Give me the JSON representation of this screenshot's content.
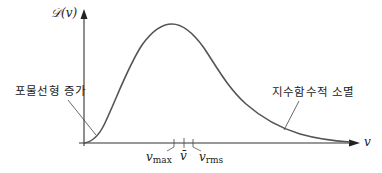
{
  "diagram": {
    "y_axis_label": "𝒟(v)",
    "x_axis_label": "v",
    "annotations": {
      "rise": "포물선형 증가",
      "decay": "지수함수적 소멸"
    },
    "ticks": {
      "v_max": {
        "base": "v",
        "sub": "max"
      },
      "v_mean": {
        "base": "v̄"
      },
      "v_rms": {
        "base": "v",
        "sub": "rms"
      }
    },
    "colors": {
      "curve": "#555555",
      "axis": "#333333",
      "text": "#222222"
    }
  }
}
